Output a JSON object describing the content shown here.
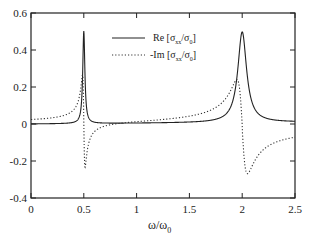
{
  "chart_data": {
    "type": "line",
    "title": "",
    "xlabel": "ω/ω0",
    "ylabel": "",
    "xlim": [
      0,
      2.5
    ],
    "ylim": [
      -0.4,
      0.6
    ],
    "grid": false,
    "legend_position": "upper-center",
    "x_ticks": [
      "0",
      "0.5",
      "1",
      "1.5",
      "2",
      "2.5"
    ],
    "y_ticks": [
      "0.6",
      "0.4",
      "0.2",
      "0",
      "-0.2",
      "-0.4"
    ],
    "series": [
      {
        "name": "Re [σxx/σ0]",
        "style": "solid",
        "x": [
          0.0,
          0.2,
          0.4,
          0.45,
          0.48,
          0.5,
          0.52,
          0.55,
          0.6,
          1.0,
          1.5,
          1.8,
          1.9,
          1.95,
          2.0,
          2.05,
          2.1,
          2.2,
          2.5
        ],
        "values": [
          0.0,
          0.005,
          0.02,
          0.05,
          0.2,
          0.5,
          0.2,
          0.07,
          0.03,
          0.005,
          0.02,
          0.07,
          0.15,
          0.3,
          0.49,
          0.3,
          0.17,
          0.08,
          0.03
        ]
      },
      {
        "name": "-Im [σxx/σ0]",
        "style": "dotted",
        "x": [
          0.0,
          0.2,
          0.4,
          0.45,
          0.49,
          0.5,
          0.51,
          0.55,
          0.7,
          1.0,
          1.5,
          1.8,
          1.95,
          2.0,
          2.05,
          2.1,
          2.2,
          2.5
        ],
        "values": [
          0.0,
          0.01,
          0.06,
          0.1,
          0.26,
          0.0,
          -0.23,
          -0.12,
          -0.05,
          0.0,
          0.06,
          0.13,
          0.24,
          0.0,
          -0.22,
          -0.27,
          -0.2,
          -0.11
        ]
      }
    ]
  },
  "legend": {
    "items": [
      {
        "main": "Re [σ",
        "sub1": "xx",
        "mid": "/σ",
        "sub2": "0",
        "end": "]"
      },
      {
        "main": "-Im [σ",
        "sub1": "xx",
        "mid": "/σ",
        "sub2": "0",
        "end": "]"
      }
    ]
  },
  "axis": {
    "x_label_main": "ω/ω",
    "x_label_sub": "0"
  }
}
